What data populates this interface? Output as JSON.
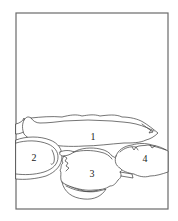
{
  "diagram": {
    "frame": {
      "x": 16,
      "y": 13,
      "width": 152,
      "height": 196,
      "stroke": "#6a6a6a"
    },
    "regions": [
      {
        "id": "1",
        "label": "1",
        "label_x": 93,
        "label_y": 137
      },
      {
        "id": "2",
        "label": "2",
        "label_x": 34,
        "label_y": 158
      },
      {
        "id": "3",
        "label": "3",
        "label_x": 92,
        "label_y": 174
      },
      {
        "id": "4",
        "label": "4",
        "label_x": 145,
        "label_y": 159
      }
    ],
    "line_color": "#3a3a3a",
    "background": "#ffffff"
  }
}
